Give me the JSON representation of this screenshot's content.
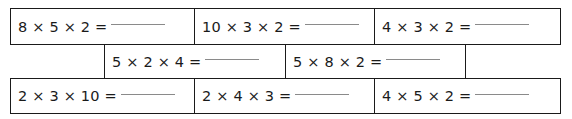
{
  "worksheet": {
    "title": "Multiplication three-factor practice grid",
    "blank_label": "answer blank",
    "rows": [
      {
        "id": "row-1",
        "cells": [
          {
            "id": "cell-1-1",
            "expression": "8 × 5 × 2 =",
            "has_blank": true
          },
          {
            "id": "cell-1-2",
            "expression": "10 × 3 × 2 =",
            "has_blank": true
          },
          {
            "id": "cell-1-3",
            "expression": "4 × 3 × 2 =",
            "has_blank": true
          }
        ]
      },
      {
        "id": "row-2",
        "cells": [
          {
            "id": "cell-2-0",
            "expression": "",
            "has_blank": false
          },
          {
            "id": "cell-2-1",
            "expression": "5 × 2 × 4 =",
            "has_blank": true
          },
          {
            "id": "cell-2-2",
            "expression": "5 × 8 × 2 =",
            "has_blank": true
          },
          {
            "id": "cell-2-3",
            "expression": "",
            "has_blank": false
          }
        ]
      },
      {
        "id": "row-3",
        "cells": [
          {
            "id": "cell-3-1",
            "expression": "2 × 3 × 10 =",
            "has_blank": true
          },
          {
            "id": "cell-3-2",
            "expression": "2 × 4 × 3 =",
            "has_blank": true
          },
          {
            "id": "cell-3-3",
            "expression": "4 × 5 × 2 =",
            "has_blank": true
          }
        ]
      }
    ]
  },
  "colors": {
    "border": "#1a1a1a",
    "text": "#1a1a1a",
    "blank_line": "#8a8a8a",
    "background": "#ffffff"
  }
}
